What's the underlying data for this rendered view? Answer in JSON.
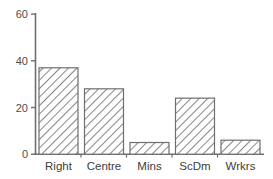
{
  "chart_data": {
    "type": "bar",
    "title": "",
    "subtitle": "",
    "xlabel": "",
    "ylabel": "",
    "categories": [
      "Right",
      "Centre",
      "Mins",
      "ScDm",
      "Wrkrs"
    ],
    "values": [
      37,
      28,
      5,
      24,
      6
    ],
    "ylim": [
      0,
      60
    ],
    "yticks": [
      0,
      20,
      40,
      60
    ],
    "ytick_labels": [
      "0",
      "20",
      "40",
      "60"
    ],
    "grid": false,
    "legend": null,
    "bar_style": {
      "fill": "white",
      "hatch": "diagonal-lines",
      "hatch_color": "#808080",
      "edge_color": "#6e6e6e"
    },
    "axis_color": "#6e6e6e"
  },
  "axes": {
    "y_axis_name": "y-axis",
    "x_axis_name": "x-axis"
  }
}
